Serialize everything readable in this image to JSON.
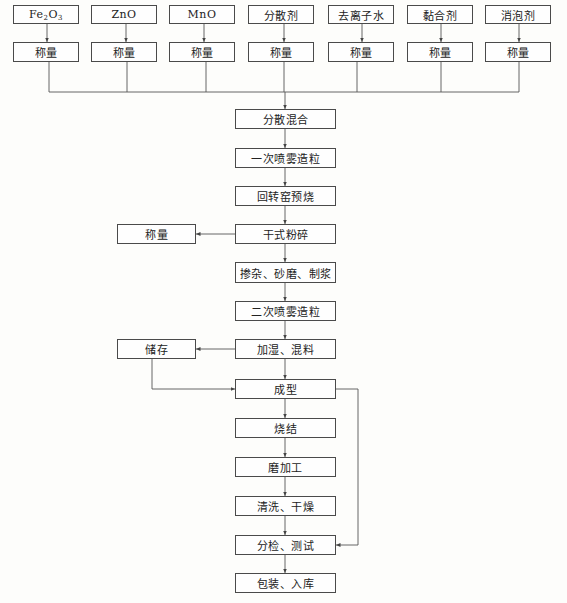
{
  "diagram": {
    "type": "process-flowchart",
    "raw_materials": [
      {
        "label_main": "Fe",
        "label_sub1": "2",
        "label_mid": "O",
        "label_sub2": "3"
      },
      {
        "label": "ZnO"
      },
      {
        "label": "MnO"
      },
      {
        "label": "分散剂"
      },
      {
        "label": "去离子水"
      },
      {
        "label": "黏合剂"
      },
      {
        "label": "消泡剂"
      }
    ],
    "weigh_label": "称量",
    "main_steps": [
      "分散混合",
      "一次喷雾造粒",
      "回转窑预烧",
      "干式粉碎",
      "掺杂、砂磨、制浆",
      "二次喷雾造粒",
      "加湿、混料",
      "成型",
      "烧结",
      "磨加工",
      "清洗、干燥",
      "分检、测试",
      "包装、入库"
    ],
    "side_nodes": {
      "weigh_side": "称量",
      "storage": "储存"
    },
    "edges": [
      {
        "from": "raw_materials[*]",
        "to": "称量 (each)"
      },
      {
        "from": "称量 (all)",
        "to": "分散混合"
      },
      {
        "from": "分散混合",
        "to": "一次喷雾造粒"
      },
      {
        "from": "一次喷雾造粒",
        "to": "回转窑预烧"
      },
      {
        "from": "回转窑预烧",
        "to": "干式粉碎"
      },
      {
        "from": "干式粉碎",
        "to": "称量 (side)"
      },
      {
        "from": "干式粉碎",
        "to": "掺杂、砂磨、制浆"
      },
      {
        "from": "掺杂、砂磨、制浆",
        "to": "二次喷雾造粒"
      },
      {
        "from": "二次喷雾造粒",
        "to": "加湿、混料"
      },
      {
        "from": "加湿、混料",
        "to": "储存"
      },
      {
        "from": "储存",
        "to": "成型"
      },
      {
        "from": "加湿、混料",
        "to": "成型"
      },
      {
        "from": "成型",
        "to": "烧结"
      },
      {
        "from": "烧结",
        "to": "磨加工"
      },
      {
        "from": "磨加工",
        "to": "清洗、干燥"
      },
      {
        "from": "清洗、干燥",
        "to": "分检、测试"
      },
      {
        "from": "成型",
        "to": "分检、测试",
        "route": "right-loop"
      },
      {
        "from": "分检、测试",
        "to": "包装、入库"
      }
    ],
    "colors": {
      "line": "#4a4a4a",
      "box_border": "#4a4a4a",
      "background": "#fdfdfb"
    }
  }
}
